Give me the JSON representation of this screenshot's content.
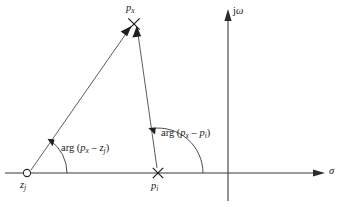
{
  "figure": {
    "kind": "s-plane-pole-zero-angle-diagram",
    "background_color": "#ffffff",
    "line_color": "#3a3a3a",
    "text_color": "#1a1a1a"
  },
  "axes": {
    "real": {
      "name": "real-axis",
      "label": "σ",
      "y": 173,
      "x_start": 5,
      "x_end": 325,
      "arrow": "right"
    },
    "imaginary": {
      "name": "imaginary-axis",
      "label_rm": "j",
      "label_it": "ω",
      "x": 228,
      "y_top": 10,
      "y_bottom": 201,
      "arrow": "up"
    }
  },
  "markers": {
    "zero": {
      "glyph": "open-circle",
      "label_base": "z",
      "label_sub": "j",
      "x": 27,
      "y": 173
    },
    "pole": {
      "glyph": "cross",
      "label_base": "p",
      "label_sub": "i",
      "x": 158,
      "y": 173
    },
    "test_point": {
      "glyph": "cross",
      "label_base": "p",
      "label_sub": "x",
      "x": 134,
      "y": 24
    }
  },
  "vectors": [
    {
      "name": "vector-zero-to-test-point",
      "from": "zero",
      "to": "test_point",
      "x1": 31,
      "y1": 170,
      "x2": 129,
      "y2": 30,
      "arrow_at": "end"
    },
    {
      "name": "vector-pole-to-test-point",
      "from": "pole",
      "to": "test_point",
      "x1": 157,
      "y1": 168,
      "x2": 137,
      "y2": 31,
      "arrow_at": "end"
    }
  ],
  "angles": [
    {
      "name": "angle-arg-px-minus-zj",
      "vertex": "zero",
      "arc_radius": 40,
      "label": {
        "fn": "arg",
        "open": "(",
        "term1_base": "p",
        "term1_sub": "x",
        "operator": "–",
        "term2_base": "z",
        "term2_sub": "j",
        "close": ")"
      },
      "label_text": "arg (p x – z j )"
    },
    {
      "name": "angle-arg-px-minus-pi",
      "vertex": "pole",
      "arc_radius": 45,
      "label": {
        "fn": "arg",
        "open": "(",
        "term1_base": "p",
        "term1_sub": "x",
        "operator": "–",
        "term2_base": "p",
        "term2_sub": "i",
        "close": ")"
      },
      "label_text": "arg (p x – p i )"
    }
  ]
}
